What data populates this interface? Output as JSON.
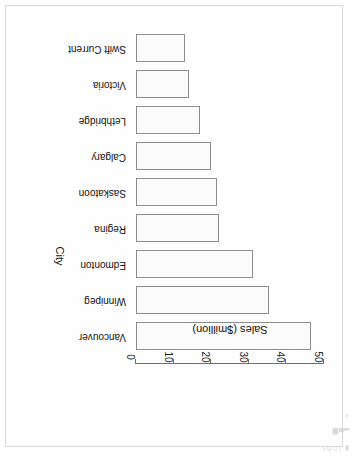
{
  "statusbar": {
    "time": "10:03",
    "icons": [
      "signal-icon",
      "wifi-icon",
      "battery-icon"
    ],
    "glyph_signal": "▂▄▆",
    "glyph_wifi": "◗",
    "glyph_battery": "▮"
  },
  "chart_data": {
    "type": "bar",
    "orientation": "vertical",
    "title": "",
    "xlabel": "City",
    "ylabel": "Sales ($million)",
    "categories": [
      "Vancouver",
      "Winnipeg",
      "Edmonton",
      "Regina",
      "Saskatoon",
      "Calgary",
      "Lethbridge",
      "Victoria",
      "Swift Current"
    ],
    "values": [
      46.5,
      35.5,
      31.0,
      22.0,
      21.5,
      20.0,
      17.0,
      14.0,
      13.0
    ],
    "ylim": [
      0,
      50
    ],
    "yticks": [
      0,
      10,
      20,
      30,
      40,
      50
    ],
    "ytick_labels": [
      "0",
      "10",
      "20",
      "30",
      "40",
      "50"
    ],
    "grid": false,
    "legend": false,
    "bar_fill": "#fbfbfb",
    "bar_edge": "#8c8c8c"
  }
}
